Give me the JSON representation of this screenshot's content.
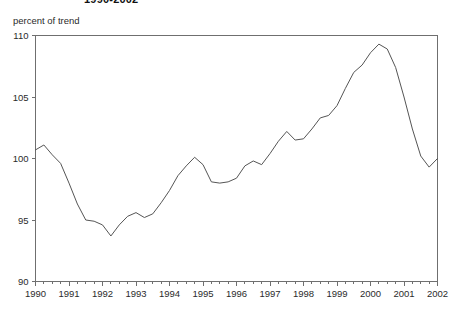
{
  "chart_data": {
    "type": "line",
    "title": "1990-2002",
    "subtitle": "",
    "ylabel": "percent of trend",
    "xlabel": "",
    "ylim": [
      90,
      110
    ],
    "xlim": [
      1990.0,
      2002.0
    ],
    "yticks": [
      90,
      95,
      100,
      105,
      110
    ],
    "ytick_labels": [
      "90",
      "95",
      "100",
      "105",
      "110"
    ],
    "xticks": [
      1990,
      1991,
      1992,
      1993,
      1994,
      1995,
      1996,
      1997,
      1998,
      1999,
      2000,
      2001,
      2002
    ],
    "xtick_labels": [
      "1990",
      "1991",
      "1992",
      "1993",
      "1994",
      "1995",
      "1996",
      "1997",
      "1998",
      "1999",
      "2000",
      "2001",
      "2002"
    ],
    "minor_tick_interval": 0.25,
    "grid": false,
    "legend": false,
    "legend_position": "none",
    "frame_sides": [
      "top",
      "left",
      "right",
      "bottom"
    ],
    "line_color": "#555555",
    "background_color": "#ffffff",
    "series": [
      {
        "name": "percent of trend",
        "x": [
          1990.0,
          1990.25,
          1990.5,
          1990.75,
          1991.0,
          1991.25,
          1991.5,
          1991.75,
          1992.0,
          1992.25,
          1992.5,
          1992.75,
          1993.0,
          1993.25,
          1993.5,
          1993.75,
          1994.0,
          1994.25,
          1994.5,
          1994.75,
          1995.0,
          1995.25,
          1995.5,
          1995.75,
          1996.0,
          1996.25,
          1996.5,
          1996.75,
          1997.0,
          1997.25,
          1997.5,
          1997.75,
          1998.0,
          1998.25,
          1998.5,
          1998.75,
          1999.0,
          1999.25,
          1999.5,
          1999.75,
          2000.0,
          2000.25,
          2000.5,
          2000.75,
          2001.0,
          2001.25,
          2001.5,
          2001.75,
          2002.0
        ],
        "values": [
          100.7,
          101.1,
          100.3,
          99.6,
          98.0,
          96.3,
          95.0,
          94.9,
          94.6,
          93.7,
          94.6,
          95.3,
          95.6,
          95.2,
          95.5,
          96.4,
          97.4,
          98.6,
          99.4,
          100.1,
          99.5,
          98.1,
          98.0,
          98.1,
          98.4,
          99.4,
          99.8,
          99.5,
          100.4,
          101.4,
          102.2,
          101.5,
          101.6,
          102.4,
          103.3,
          103.5,
          104.3,
          105.7,
          107.0,
          107.6,
          108.6,
          109.3,
          108.9,
          107.4,
          105.0,
          102.4,
          100.2,
          99.3,
          100.0
        ]
      }
    ]
  }
}
